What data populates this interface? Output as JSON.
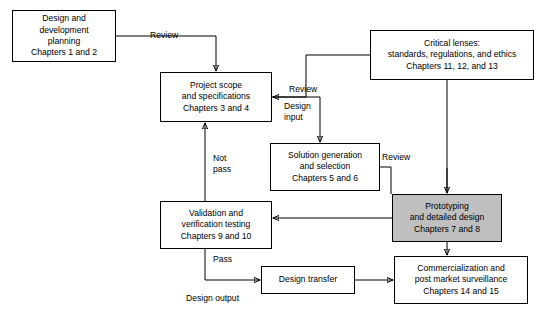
{
  "diagram": {
    "type": "flowchart",
    "nodes": [
      {
        "id": "design-development-planning",
        "lines": [
          "Design and",
          "development",
          "planning",
          "Chapters 1 and 2"
        ],
        "shaded": false,
        "x": 12,
        "y": 10,
        "w": 104,
        "h": 52
      },
      {
        "id": "project-scope-specifications",
        "lines": [
          "Project scope",
          "and specifications",
          "Chapters 3 and 4"
        ],
        "shaded": false,
        "x": 160,
        "y": 72,
        "w": 112,
        "h": 50
      },
      {
        "id": "critical-lenses",
        "lines": [
          "Critical lenses:",
          "standards, regulations, and ethics",
          "Chapters 11, 12, and 13"
        ],
        "shaded": false,
        "x": 370,
        "y": 30,
        "w": 164,
        "h": 50
      },
      {
        "id": "solution-generation-selection",
        "lines": [
          "Solution generation",
          "and selection",
          "Chapters 5 and 6"
        ],
        "shaded": false,
        "x": 270,
        "y": 143,
        "w": 110,
        "h": 48
      },
      {
        "id": "prototyping-detailed-design",
        "lines": [
          "Prototyping",
          "and detailed design",
          "Chapters 7 and 8"
        ],
        "shaded": true,
        "x": 392,
        "y": 194,
        "w": 110,
        "h": 48
      },
      {
        "id": "validation-verification-testing",
        "lines": [
          "Validation and",
          "verification testing",
          "Chapters 9 and 10"
        ],
        "shaded": false,
        "x": 160,
        "y": 201,
        "w": 112,
        "h": 48
      },
      {
        "id": "design-transfer",
        "lines": [
          "Design transfer"
        ],
        "shaded": false,
        "x": 261,
        "y": 266,
        "w": 94,
        "h": 28
      },
      {
        "id": "commercialization-post-market",
        "lines": [
          "Commercialization and",
          "post market surveillance",
          "Chapters 14 and 15"
        ],
        "shaded": false,
        "x": 394,
        "y": 256,
        "w": 134,
        "h": 48
      }
    ],
    "edge_labels": [
      {
        "id": "review-top",
        "text": "Review",
        "x": 150,
        "y": 30
      },
      {
        "id": "review-critical-lenses-left",
        "text": "Review",
        "x": 289,
        "y": 84
      },
      {
        "id": "design-input",
        "text": "Design\ninput",
        "x": 284,
        "y": 101
      },
      {
        "id": "review-prototyping",
        "text": "Review",
        "x": 382,
        "y": 152
      },
      {
        "id": "not-pass",
        "text": "Not\npass",
        "x": 213,
        "y": 153
      },
      {
        "id": "pass",
        "text": "Pass",
        "x": 213,
        "y": 254
      },
      {
        "id": "design-output",
        "text": "Design output",
        "x": 186,
        "y": 293
      }
    ]
  }
}
